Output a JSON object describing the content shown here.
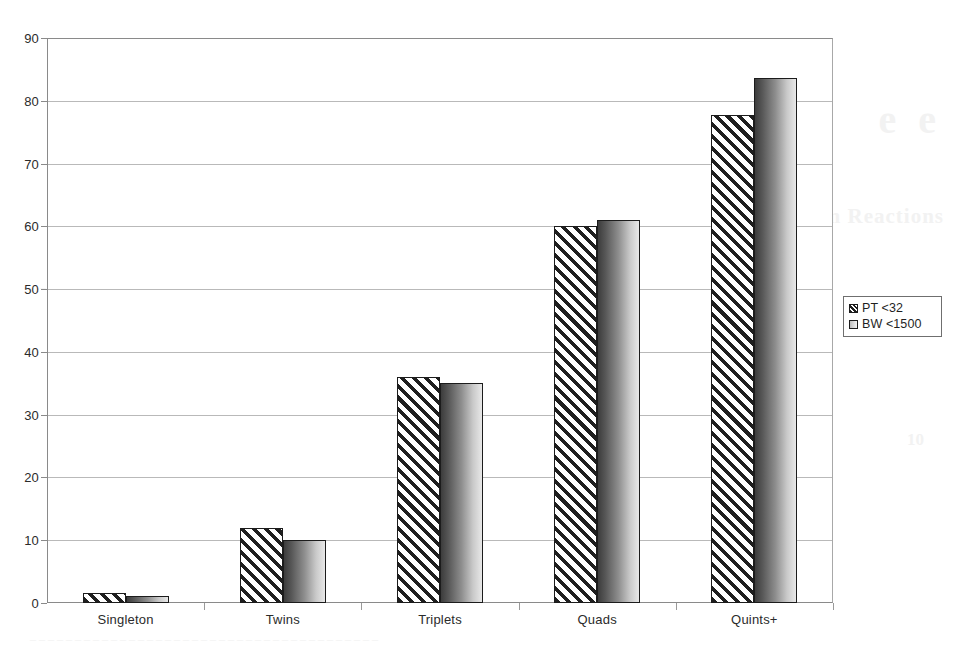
{
  "chart_data": {
    "type": "bar",
    "title": "",
    "subtitle": "",
    "xlabel": "",
    "ylabel": "",
    "categories": [
      "Singleton",
      "Twins",
      "Triplets",
      "Quads",
      "Quints+"
    ],
    "series": [
      {
        "name": "PT <32",
        "values": [
          1.6,
          12.0,
          36.0,
          60.0,
          77.8
        ]
      },
      {
        "name": "BW <1500",
        "values": [
          1.1,
          10.0,
          35.0,
          61.0,
          83.7
        ]
      }
    ],
    "ylim": [
      0,
      90
    ],
    "ytick_values": [
      0,
      10,
      20,
      30,
      40,
      50,
      60,
      70,
      80,
      90
    ],
    "ytick_labels": [
      "0",
      "10",
      "20",
      "30",
      "40",
      "50",
      "60",
      "70",
      "80",
      "90"
    ],
    "grid": "horizontal",
    "legend_position": "right",
    "legend_entries": [
      {
        "label": "PT <32",
        "swatch": "diagonal-hatch"
      },
      {
        "label": "BW <1500",
        "swatch": "gray-gradient"
      }
    ],
    "colors": {
      "axis": "#8a8a8a",
      "gridline": "#b9b9b9",
      "bar_outline": "#1c1c1c",
      "text": "#2b2b2b",
      "background": "#ffffff"
    }
  },
  "bleed_through": {
    "line1": "e e",
    "line2": "m Reactions",
    "line3": "_______________________________________",
    "line4": "10",
    "line5": "_______________________________________",
    "line6": "10"
  }
}
